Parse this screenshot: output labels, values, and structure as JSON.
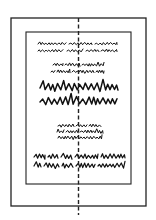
{
  "diagram": {
    "title": "Symmetrical page layout",
    "description": "Page frame with centered text blocks aligned on a dashed vertical axis",
    "canvas": {
      "width": 156,
      "height": 220,
      "background": "#ffffff"
    },
    "colors": {
      "stroke": "#222222",
      "ink": "#111111"
    },
    "outer_frame": {
      "x": 11,
      "y": 18,
      "width": 135,
      "height": 188,
      "stroke_width": 1.3
    },
    "inner_frame": {
      "x": 26,
      "y": 32,
      "width": 105,
      "height": 152,
      "stroke_width": 1.1
    },
    "center_axis": {
      "x": 78.5,
      "y1": 18,
      "y2": 215,
      "style": "dashed"
    },
    "text_blocks": [
      {
        "id": "block-1",
        "style": "small light script",
        "lines": [
          {
            "y": 44,
            "x1": 38,
            "x2": 117,
            "amp": 1.4,
            "wave": 2.2,
            "gaps": [
              [
                66,
                69
              ],
              [
                92,
                95
              ]
            ],
            "weight": 1.0
          },
          {
            "y": 51,
            "x1": 38,
            "x2": 117,
            "amp": 1.4,
            "wave": 2.2,
            "gaps": [
              [
                63,
                67
              ],
              [
                83,
                86
              ],
              [
                99,
                101
              ]
            ],
            "weight": 1.0
          }
        ]
      },
      {
        "id": "block-2",
        "style": "small script",
        "lines": [
          {
            "y": 65,
            "x1": 53,
            "x2": 104,
            "amp": 1.6,
            "wave": 2.0,
            "gaps": [
              [
                63,
                65
              ],
              [
                80,
                82
              ]
            ],
            "weight": 1.0
          },
          {
            "y": 72,
            "x1": 51,
            "x2": 104,
            "amp": 1.6,
            "wave": 2.0,
            "gaps": [
              [
                55,
                57
              ],
              [
                70,
                72
              ],
              [
                94,
                96
              ]
            ],
            "weight": 1.0
          }
        ]
      },
      {
        "id": "block-3",
        "style": "large zigzag display",
        "lines": [
          {
            "y": 88,
            "x1": 40,
            "x2": 118,
            "amp": 4.5,
            "wave": 3.4,
            "gaps": [],
            "weight": 1.5
          },
          {
            "y": 102,
            "x1": 40,
            "x2": 117,
            "amp": 4.5,
            "wave": 3.4,
            "gaps": [],
            "weight": 1.5
          }
        ]
      },
      {
        "id": "block-4",
        "style": "small three-line script",
        "lines": [
          {
            "y": 126,
            "x1": 58,
            "x2": 101,
            "amp": 1.7,
            "wave": 2.0,
            "gaps": [
              [
                74,
                76
              ],
              [
                87,
                89
              ]
            ],
            "weight": 1.0
          },
          {
            "y": 132,
            "x1": 57,
            "x2": 103,
            "amp": 1.7,
            "wave": 2.0,
            "gaps": [
              [
                64,
                66
              ],
              [
                78,
                80
              ]
            ],
            "weight": 1.0
          },
          {
            "y": 138,
            "x1": 58,
            "x2": 102,
            "amp": 1.7,
            "wave": 2.0,
            "gaps": [],
            "weight": 1.0
          }
        ]
      },
      {
        "id": "block-5",
        "style": "tall justified script",
        "lines": [
          {
            "y": 157,
            "x1": 34,
            "x2": 125,
            "amp": 2.6,
            "wave": 2.4,
            "gaps": [
              [
                45,
                48
              ],
              [
                58,
                61
              ],
              [
                72,
                75
              ],
              [
                98,
                101
              ]
            ],
            "weight": 1.2
          },
          {
            "y": 166,
            "x1": 34,
            "x2": 125,
            "amp": 2.6,
            "wave": 2.4,
            "gaps": [
              [
                41,
                44
              ],
              [
                59,
                62
              ],
              [
                73,
                76
              ],
              [
                95,
                98
              ]
            ],
            "weight": 1.2
          }
        ]
      }
    ]
  }
}
